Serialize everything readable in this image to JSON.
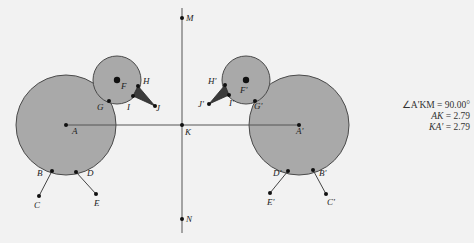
{
  "figure": {
    "type": "geometric-reflection-diagram",
    "colors": {
      "background": "#f2f2f2",
      "circle_fill": "#a9a9a9",
      "circle_stroke": "#4a4a4a",
      "line": "#555555",
      "beak_fill": "#3a3a3a",
      "point": "#111111"
    },
    "mirror_line": {
      "from": "M",
      "to": "N"
    },
    "points": {
      "M": {
        "x": 182,
        "y": 18,
        "label": "M",
        "lx": 186,
        "ly": 21
      },
      "N": {
        "x": 182,
        "y": 219,
        "label": "N",
        "lx": 186,
        "ly": 222
      },
      "K": {
        "x": 182,
        "y": 125,
        "label": "K",
        "lx": 185,
        "ly": 135
      },
      "A": {
        "x": 66,
        "y": 125,
        "label": "A",
        "lx": 72,
        "ly": 134
      },
      "F": {
        "x": 117,
        "y": 80,
        "label": "F",
        "lx": 121,
        "ly": 89
      },
      "G": {
        "x": 109,
        "y": 101,
        "label": "G",
        "lx": 97,
        "ly": 110
      },
      "H": {
        "x": 138,
        "y": 86,
        "label": "H",
        "lx": 143,
        "ly": 84
      },
      "I": {
        "x": 133,
        "y": 96,
        "label": "I",
        "lx": 127,
        "ly": 110
      },
      "J": {
        "x": 155,
        "y": 106,
        "label": "J",
        "lx": 156,
        "ly": 111
      },
      "B": {
        "x": 52,
        "y": 171,
        "label": "B",
        "lx": 37,
        "ly": 176
      },
      "C": {
        "x": 39,
        "y": 196,
        "label": "C",
        "lx": 34,
        "ly": 208
      },
      "D": {
        "x": 76,
        "y": 172,
        "label": "D",
        "lx": 87,
        "ly": 176
      },
      "E": {
        "x": 96,
        "y": 194,
        "label": "E",
        "lx": 94,
        "ly": 206
      },
      "A'": {
        "x": 299,
        "y": 125,
        "label": "A'",
        "lx": 296,
        "ly": 134
      },
      "F'": {
        "x": 246,
        "y": 80,
        "label": "F'",
        "lx": 240,
        "ly": 93
      },
      "G'": {
        "x": 255,
        "y": 101,
        "label": "G'",
        "lx": 254,
        "ly": 109
      },
      "H'": {
        "x": 225,
        "y": 85,
        "label": "H'",
        "lx": 208,
        "ly": 84
      },
      "I'": {
        "x": 229,
        "y": 95,
        "label": "I'",
        "lx": 229,
        "ly": 106
      },
      "J'": {
        "x": 209,
        "y": 104,
        "label": "J'",
        "lx": 198,
        "ly": 107
      },
      "B'": {
        "x": 313,
        "y": 170,
        "label": "B'",
        "lx": 319,
        "ly": 176
      },
      "C'": {
        "x": 326,
        "y": 194,
        "label": "C'",
        "lx": 327,
        "ly": 205
      },
      "D'": {
        "x": 288,
        "y": 171,
        "label": "D'",
        "lx": 273,
        "ly": 176
      },
      "E'": {
        "x": 270,
        "y": 193,
        "label": "E'",
        "lx": 267,
        "ly": 205
      }
    },
    "circles": [
      {
        "name": "body",
        "center": "A",
        "r": 50
      },
      {
        "name": "head",
        "center": "F",
        "r": 24
      },
      {
        "name": "body-reflected",
        "center": "A'",
        "r": 50
      },
      {
        "name": "head-reflected",
        "center": "F'",
        "r": 24
      }
    ],
    "segments": [
      [
        "A",
        "A'"
      ],
      [
        "B",
        "C"
      ],
      [
        "D",
        "E"
      ],
      [
        "B'",
        "C'"
      ],
      [
        "D'",
        "E'"
      ]
    ],
    "beaks": [
      [
        "H",
        "I",
        "J"
      ],
      [
        "H'",
        "I'",
        "J'"
      ]
    ]
  },
  "measurements": [
    {
      "label": "∠A'KM",
      "value": "90.00°"
    },
    {
      "label": "AK",
      "value": "2.79"
    },
    {
      "label": "KA'",
      "value": "2.79"
    }
  ]
}
